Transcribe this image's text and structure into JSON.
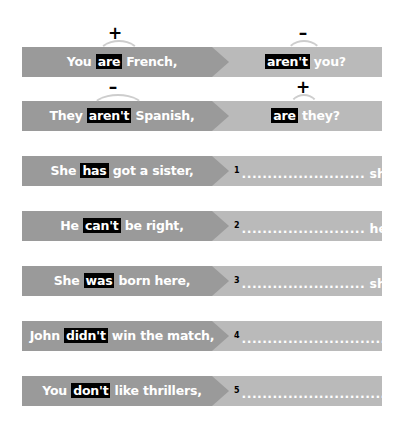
{
  "colors": {
    "left_bar": "#9a9a9a",
    "right_bar": "#bababa",
    "highlight_bg": "#000000",
    "text": "#ffffff"
  },
  "examples": [
    {
      "left": {
        "before": "You ",
        "highlight": "are",
        "after": " French,"
      },
      "right": {
        "highlight": "aren't",
        "after": " you?"
      },
      "left_sign": "+",
      "right_sign": "–"
    },
    {
      "left": {
        "before": "They ",
        "highlight": "aren't",
        "after": " Spanish,"
      },
      "right": {
        "highlight": "are",
        "after": " they?"
      },
      "left_sign": "–",
      "right_sign": "+"
    }
  ],
  "exercises": [
    {
      "left": {
        "before": "She ",
        "highlight": "has",
        "after": " got a sister,"
      },
      "number": "1",
      "blank": "........................",
      "tail": " she?"
    },
    {
      "left": {
        "before": "He ",
        "highlight": "can't",
        "after": " be right,"
      },
      "number": "2",
      "blank": "........................",
      "tail": " he?"
    },
    {
      "left": {
        "before": "She ",
        "highlight": "was",
        "after": " born here,"
      },
      "number": "3",
      "blank": "........................",
      "tail": " she?"
    },
    {
      "left": {
        "before": "John ",
        "highlight": "didn't",
        "after": " win the match,"
      },
      "number": "4",
      "blank": "...............................",
      "tail": "?"
    },
    {
      "left": {
        "before": "You ",
        "highlight": "don't",
        "after": " like thrillers,"
      },
      "number": "5",
      "blank": "...............................",
      "tail": "?"
    }
  ]
}
